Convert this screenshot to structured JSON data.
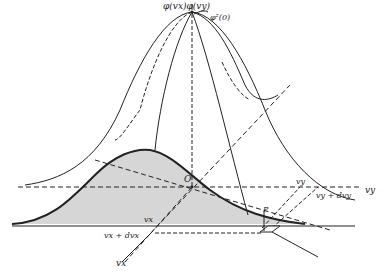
{
  "diagram": {
    "labels": {
      "top_product": "φ(vx)φ(vy)",
      "peak": "φ²(0)",
      "origin": "O",
      "vy_axis": "vy",
      "vy_tick": "vy",
      "vy_plus": "vy + dvy",
      "vx_tick": "vx",
      "vx_plus": "vx + dvx",
      "vx_axis": "vx",
      "point": "P"
    },
    "colors": {
      "line": "#222222",
      "shade": "#d6d6d6"
    }
  }
}
